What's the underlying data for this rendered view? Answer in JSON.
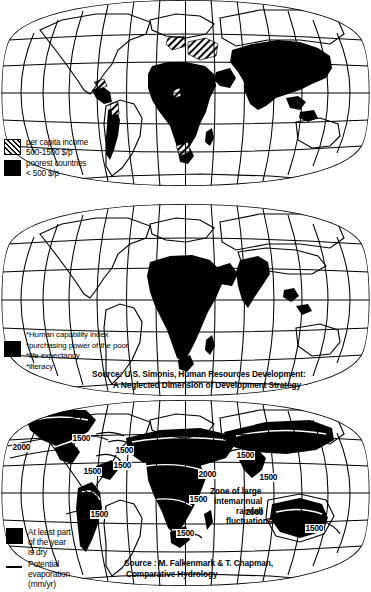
{
  "figure": {
    "projection": "oval pseudocylindrical (Mollweide-like) world projection with graticule"
  },
  "panels": [
    {
      "id": "map-income",
      "caption": "World map of per capita income and poorest countries",
      "legend": [
        {
          "swatch": "hatch",
          "line1": "per capita income",
          "line2": "500-1500 $/p"
        },
        {
          "swatch": "solid",
          "line1": "poorest countries",
          "line2": "< 500 $/p"
        }
      ]
    },
    {
      "id": "map-human-capability",
      "caption": "World map of the human capability index",
      "legend": {
        "swatch": "solid",
        "items": [
          "*Human capability index",
          "*purchasing power of the poor",
          "*life expectancy",
          "*literacy"
        ]
      },
      "source": {
        "line1": "Source: U.S. Simonis, Human Resources Development:",
        "line2": "A Neglected Dimension of Development Strategy"
      }
    },
    {
      "id": "map-dryness",
      "caption": "World map of dry season extent and potential evaporation",
      "legend": [
        {
          "swatch": "solid",
          "line1": "At least part",
          "line2": "of the year",
          "line3": "is dry"
        },
        {
          "swatch": "rule",
          "line1": "Potential",
          "line2": "evaporation",
          "line3": "(mm/yr)"
        }
      ],
      "annotation": {
        "line1": "Zone of large",
        "line2": "intemannual",
        "line3": "rainfall",
        "line4": "fluctuations"
      },
      "source": {
        "line1": "Source : M. Falkenmark & T. Chapman,",
        "line2": "Comparative Hydrology"
      },
      "contour_labels": [
        {
          "value": "2000",
          "x": 12,
          "y": 443
        },
        {
          "value": "1500",
          "x": 72,
          "y": 434
        },
        {
          "value": "1500",
          "x": 83,
          "y": 467
        },
        {
          "value": "1500",
          "x": 115,
          "y": 446
        },
        {
          "value": "1500",
          "x": 113,
          "y": 461
        },
        {
          "value": "1500",
          "x": 236,
          "y": 451
        },
        {
          "value": "2000",
          "x": 198,
          "y": 470
        },
        {
          "value": "1500",
          "x": 259,
          "y": 473
        },
        {
          "value": "1500",
          "x": 90,
          "y": 510
        },
        {
          "value": "1500",
          "x": 176,
          "y": 529
        },
        {
          "value": "1500",
          "x": 189,
          "y": 495
        },
        {
          "value": "2000",
          "x": 245,
          "y": 508
        },
        {
          "value": "1500",
          "x": 305,
          "y": 524
        }
      ]
    }
  ],
  "chart_data": {
    "type": "map",
    "maps": [
      {
        "name": "per capita income",
        "classes": [
          {
            "label": "per capita income 500-1500 $/p",
            "fill": "hatch"
          },
          {
            "label": "poorest countries < 500 $/p",
            "fill": "solid-black"
          }
        ],
        "regions_solid": [
          "Africa (most)",
          "South Asia",
          "China",
          "Southeast Asia",
          "Central America",
          "Andean South America"
        ],
        "regions_hatched": [
          "Eastern Europe",
          "Turkey",
          "Middle East",
          "Mexico",
          "Andes",
          "Southern Africa"
        ]
      },
      {
        "name": "human capability index",
        "classes": [
          {
            "label": "Human capability index (low)",
            "fill": "solid-black"
          }
        ],
        "components": [
          "purchasing power of the poor",
          "life expectancy",
          "literacy"
        ],
        "regions_solid": [
          "Sub-Saharan Africa",
          "Sahel",
          "South Asia",
          "Arabian Peninsula",
          "parts of Southeast Asia"
        ]
      },
      {
        "name": "dryness and potential evaporation",
        "classes": [
          {
            "label": "At least part of the year is dry",
            "fill": "solid-black"
          },
          {
            "label": "Potential evaporation (mm/yr)",
            "fill": "contour-line"
          }
        ],
        "contour_values_mm_per_yr": [
          1500,
          2000
        ],
        "regions_solid": [
          "Western North America",
          "Northern Africa / Sahara",
          "Southern Africa",
          "Middle East",
          "Central Asia",
          "India",
          "Australia",
          "Western South America"
        ]
      }
    ]
  }
}
